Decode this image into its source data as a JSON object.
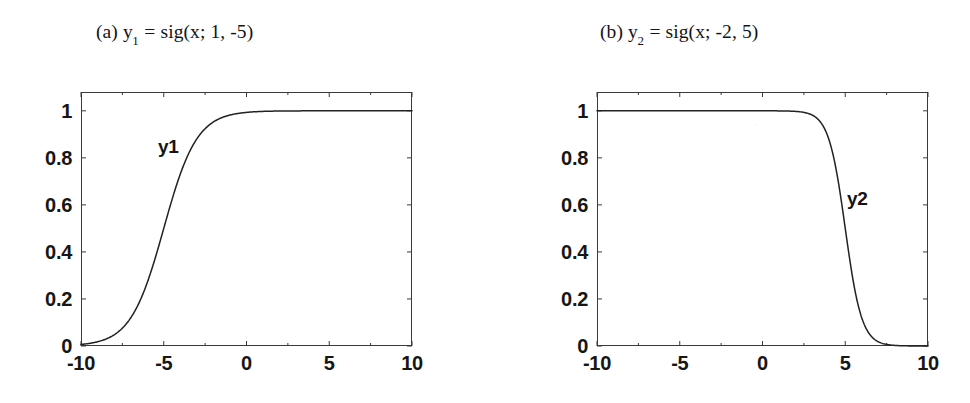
{
  "figure": {
    "panels": [
      {
        "id": "a",
        "caption_prefix": "(a) y",
        "caption_subscript": "1",
        "caption_suffix": " = sig(x; 1, -5)",
        "caption_full": "(a) y1 = sig(x; 1, -5)",
        "curve_label": "y1",
        "xticks": [
          "-10",
          "-5",
          "0",
          "5",
          "10"
        ],
        "yticks": [
          "0",
          "0.2",
          "0.4",
          "0.6",
          "0.8",
          "1"
        ]
      },
      {
        "id": "b",
        "caption_prefix": "(b) y",
        "caption_subscript": "2",
        "caption_suffix": " = sig(x; -2, 5)",
        "caption_full": "(b) y2 = sig(x; -2, 5)",
        "curve_label": "y2",
        "xticks": [
          "-10",
          "-5",
          "0",
          "5",
          "10"
        ],
        "yticks": [
          "0",
          "0.2",
          "0.4",
          "0.6",
          "0.8",
          "1"
        ]
      }
    ],
    "colors": {
      "ink": "#1a1a1a",
      "axis": "#3a3a3a",
      "curve": "#222222",
      "background": "#ffffff"
    }
  },
  "chart_data": [
    {
      "type": "line",
      "title": "(a) y1 = sig(x; 1, -5)",
      "series_name": "y1",
      "formula": "y = 1 / (1 + exp(-1*(x - (-5))))",
      "params": {
        "a": 1,
        "c": -5
      },
      "xlabel": "",
      "ylabel": "",
      "xlim": [
        -10,
        10
      ],
      "ylim": [
        0,
        1.08
      ],
      "xticks": [
        -10,
        -5,
        0,
        5,
        10
      ],
      "yticks": [
        0,
        0.2,
        0.4,
        0.6,
        0.8,
        1
      ],
      "grid": false,
      "legend": "none",
      "annotations": [
        {
          "text": "y1",
          "x": -5.5,
          "y": 0.9
        }
      ],
      "x": [
        -10,
        -9,
        -8,
        -7,
        -6,
        -5,
        -4,
        -3,
        -2,
        -1,
        0,
        1,
        2,
        3,
        4,
        5,
        6,
        7,
        8,
        9,
        10
      ],
      "y": [
        0.0067,
        0.018,
        0.0474,
        0.1192,
        0.2689,
        0.5,
        0.7311,
        0.8808,
        0.9526,
        0.982,
        0.9933,
        0.9975,
        0.9991,
        0.9997,
        0.9999,
        1.0,
        1.0,
        1.0,
        1.0,
        1.0,
        1.0
      ]
    },
    {
      "type": "line",
      "title": "(b) y2 = sig(x; -2, 5)",
      "series_name": "y2",
      "formula": "y = 1 / (1 + exp(2*(x - 5)))",
      "params": {
        "a": -2,
        "c": 5
      },
      "xlabel": "",
      "ylabel": "",
      "xlim": [
        -10,
        10
      ],
      "ylim": [
        0,
        1.08
      ],
      "xticks": [
        -10,
        -5,
        0,
        5,
        10
      ],
      "yticks": [
        0,
        0.2,
        0.4,
        0.6,
        0.8,
        1
      ],
      "grid": false,
      "legend": "none",
      "annotations": [
        {
          "text": "y2",
          "x": 6.0,
          "y": 0.68
        }
      ],
      "x": [
        -10,
        -8,
        -6,
        -4,
        -2,
        0,
        1,
        2,
        3,
        4,
        5,
        6,
        7,
        8,
        9,
        10
      ],
      "y": [
        1.0,
        1.0,
        1.0,
        1.0,
        1.0,
        0.99995,
        0.9997,
        0.9982,
        0.982,
        0.8808,
        0.5,
        0.1192,
        0.018,
        0.0024,
        0.0003,
        4e-05
      ]
    }
  ]
}
